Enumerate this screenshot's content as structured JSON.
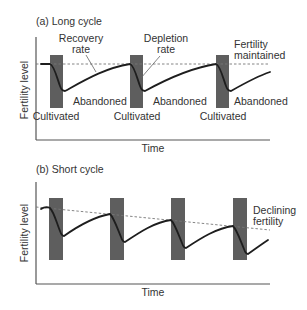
{
  "diagram": {
    "panels": [
      {
        "id": "a",
        "title": "(a) Long cycle",
        "ylabel": "Fertility level",
        "xlabel": "Time",
        "annotations": {
          "recovery": [
            "Recovery",
            "rate"
          ],
          "depletion": [
            "Depletion",
            "rate"
          ],
          "end_note": [
            "Fertility",
            "maintained"
          ]
        },
        "cultivated_label": "Cultivated",
        "abandoned_label": "Abandoned",
        "cycles": 3,
        "fertility_trend": "maintained"
      },
      {
        "id": "b",
        "title": "(b) Short cycle",
        "ylabel": "Fertility level",
        "xlabel": "Time",
        "annotations": {
          "end_note": [
            "Declining",
            "fertility"
          ]
        },
        "cycles": 4,
        "fertility_trend": "declining"
      }
    ],
    "colors": {
      "bar": "#5e5e5e",
      "curve": "#1e1e1e",
      "dashed": "#777777",
      "text": "#333333"
    }
  }
}
